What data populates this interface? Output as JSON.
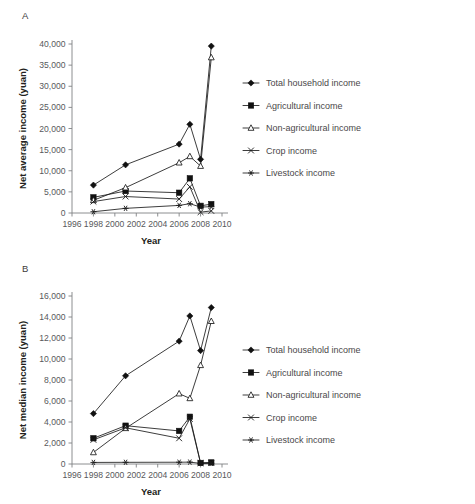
{
  "figure": {
    "panels": [
      {
        "id": "A",
        "label": "A",
        "ylabel": "Net average income (yuan)",
        "xlabel": "Year"
      },
      {
        "id": "B",
        "label": "B",
        "ylabel": "Net median income (yuan)",
        "xlabel": "Year"
      }
    ]
  },
  "chart_data": [
    {
      "type": "line",
      "panel": "A",
      "title": "",
      "xlabel": "Year",
      "ylabel": "Net average income (yuan)",
      "xlim": [
        1996,
        2010
      ],
      "ylim": [
        0,
        40000
      ],
      "xticks": [
        1996,
        1998,
        2000,
        2002,
        2004,
        2006,
        2008,
        2010
      ],
      "xtick_labels": [
        "1996",
        "1998",
        "2000",
        "2002",
        "2004",
        "2006",
        "2008",
        "2010"
      ],
      "yticks": [
        0,
        5000,
        10000,
        15000,
        20000,
        25000,
        30000,
        35000,
        40000
      ],
      "ytick_labels": [
        "0",
        "5,000",
        "10,000",
        "15,000",
        "20,000",
        "25,000",
        "30,000",
        "35,000",
        "40,000"
      ],
      "grid": false,
      "legend_position": "right",
      "x": [
        1998,
        2001,
        2006,
        2007,
        2008,
        2009
      ],
      "series": [
        {
          "name": "Total household income",
          "marker": "filled-diamond",
          "values": [
            6600,
            11400,
            16300,
            21000,
            12700,
            39500
          ]
        },
        {
          "name": "Agricultural income",
          "marker": "filled-square",
          "values": [
            3700,
            5200,
            4800,
            8200,
            1700,
            2100
          ]
        },
        {
          "name": "Non-agricultural income",
          "marker": "open-triangle",
          "values": [
            3000,
            6000,
            11900,
            13400,
            11100,
            36800
          ]
        },
        {
          "name": "Crop income",
          "marker": "cross-x",
          "values": [
            2700,
            3900,
            3300,
            6200,
            200,
            500
          ]
        },
        {
          "name": "Livestock income",
          "marker": "asterisk",
          "values": [
            300,
            1100,
            1800,
            2200,
            1400,
            1500
          ]
        }
      ]
    },
    {
      "type": "line",
      "panel": "B",
      "title": "",
      "xlabel": "Year",
      "ylabel": "Net median income (yuan)",
      "xlim": [
        1996,
        2010
      ],
      "ylim": [
        0,
        16000
      ],
      "xticks": [
        1996,
        1998,
        2000,
        2002,
        2004,
        2006,
        2008,
        2010
      ],
      "xtick_labels": [
        "1996",
        "1998",
        "2000",
        "2002",
        "2004",
        "2006",
        "2008",
        "2010"
      ],
      "yticks": [
        0,
        2000,
        4000,
        6000,
        8000,
        10000,
        12000,
        14000,
        16000
      ],
      "ytick_labels": [
        "0",
        "2,000",
        "4,000",
        "6,000",
        "8,000",
        "10,000",
        "12,000",
        "14,000",
        "16,000"
      ],
      "grid": false,
      "legend_position": "right",
      "x": [
        1998,
        2001,
        2006,
        2007,
        2008,
        2009
      ],
      "series": [
        {
          "name": "Total household income",
          "marker": "filled-diamond",
          "values": [
            4800,
            8400,
            11700,
            14100,
            10800,
            14900
          ]
        },
        {
          "name": "Agricultural income",
          "marker": "filled-square",
          "values": [
            2450,
            3650,
            3150,
            4500,
            100,
            150
          ]
        },
        {
          "name": "Non-agricultural income",
          "marker": "open-triangle",
          "values": [
            1100,
            3400,
            6700,
            6250,
            9400,
            13600
          ]
        },
        {
          "name": "Crop income",
          "marker": "cross-x",
          "values": [
            2300,
            3450,
            2450,
            4300,
            80,
            100
          ]
        },
        {
          "name": "Livestock income",
          "marker": "asterisk",
          "values": [
            150,
            160,
            170,
            180,
            60,
            70
          ]
        }
      ]
    }
  ],
  "legend": {
    "entries": [
      {
        "label": "Total household income",
        "marker": "filled-diamond"
      },
      {
        "label": "Agricultural income",
        "marker": "filled-square"
      },
      {
        "label": "Non-agricultural income",
        "marker": "open-triangle"
      },
      {
        "label": "Crop income",
        "marker": "cross-x"
      },
      {
        "label": "Livestock income",
        "marker": "asterisk"
      }
    ]
  }
}
